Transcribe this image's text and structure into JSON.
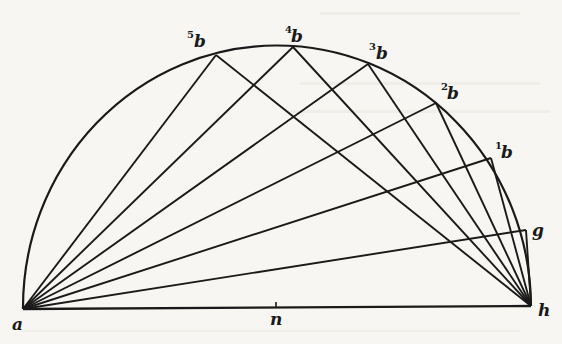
{
  "figure": {
    "ink_color": "#1a1a1a",
    "paper_color": "#f7f6f3"
  },
  "labels": {
    "a": "a",
    "h": "h",
    "n": "n",
    "g": "g",
    "b1": {
      "sup": "1",
      "base": "b"
    },
    "b2": {
      "sup": "2",
      "base": "b"
    },
    "b3": {
      "sup": "3",
      "base": "b"
    },
    "b4": {
      "sup": "4",
      "base": "b"
    },
    "b5": {
      "sup": "5",
      "base": "b"
    }
  },
  "arc_points_order": [
    "5b",
    "4b",
    "3b",
    "2b",
    "1b",
    "g"
  ],
  "chords": {
    "from_a": [
      "5b",
      "4b",
      "3b",
      "2b",
      "1b",
      "g"
    ],
    "from_h": [
      "5b",
      "4b",
      "3b",
      "2b",
      "1b",
      "g"
    ]
  }
}
